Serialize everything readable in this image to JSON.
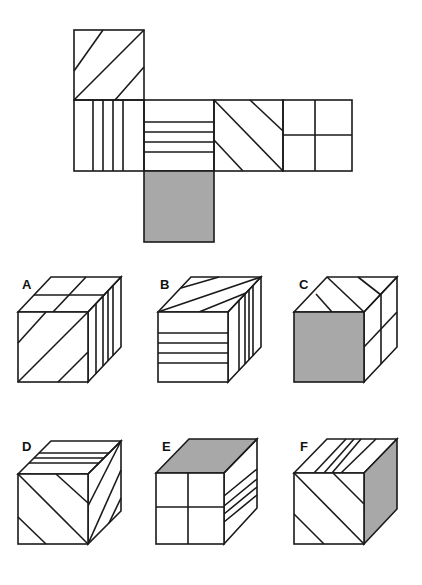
{
  "colors": {
    "line": "#1a1a1a",
    "shade": "#a8a8a8",
    "background": "#ffffff"
  },
  "net": {
    "description": "Unfolded cube net",
    "faces": [
      {
        "id": "top",
        "pattern": "diagonal-3-lines-rising"
      },
      {
        "id": "left",
        "pattern": "vertical-4-lines"
      },
      {
        "id": "center",
        "pattern": "horizontal-4-lines"
      },
      {
        "id": "right",
        "pattern": "diagonal-3-lines-falling"
      },
      {
        "id": "far-right",
        "pattern": "quarters-cross"
      },
      {
        "id": "bottom",
        "pattern": "solid-grey"
      }
    ]
  },
  "options": [
    {
      "label": "A",
      "front": "diagonal-rising",
      "top": "quarters",
      "side": "vertical-lines"
    },
    {
      "label": "B",
      "front": "horizontal-lines",
      "top": "diagonal",
      "side": "vertical-lines"
    },
    {
      "label": "C",
      "front": "solid-grey",
      "top": "diagonal-falling",
      "side": "quarters"
    },
    {
      "label": "D",
      "front": "diagonal-falling",
      "top": "horizontal-lines",
      "side": "diagonal"
    },
    {
      "label": "E",
      "front": "quarters",
      "top": "solid-grey",
      "side": "horizontal-lines"
    },
    {
      "label": "F",
      "front": "diagonal-falling",
      "top": "vertical-lines",
      "side": "solid-grey"
    }
  ]
}
